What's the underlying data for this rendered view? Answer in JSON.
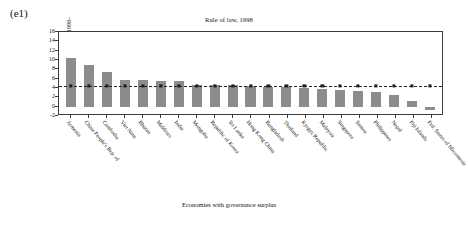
{
  "panel": {
    "label": "(e1)"
  },
  "chart_data": {
    "type": "bar",
    "title": "Rule of law, 1998",
    "xlabel": "Economies with governance surplus",
    "ylabel": "GDP per capita growth rate (%), 1998–2008",
    "ylim": [
      -2,
      16
    ],
    "yticks": [
      16,
      14,
      12,
      10,
      8,
      6,
      4,
      2,
      0,
      -2
    ],
    "grid": false,
    "legend": null,
    "reference_line": {
      "value": 4.5,
      "style": "dashed",
      "marker": "square"
    },
    "categories": [
      "Armenia",
      "China People's Rep. of",
      "Cambodia",
      "Viet Nam",
      "Bhutan",
      "Maldives",
      "India",
      "Mongolia",
      "Republic of Korea",
      "Sri Lanka",
      "Hong Kong China",
      "Bangladesh",
      "Thailand",
      "Kyrgyz Republic",
      "Malaysia",
      "Singapore",
      "Samoa",
      "Philippines",
      "Nepal",
      "Fiji Islands",
      "Fed. States of Micronesia"
    ],
    "values": [
      10.4,
      9.0,
      7.4,
      5.8,
      5.8,
      5.5,
      5.4,
      4.7,
      4.6,
      4.6,
      4.5,
      4.3,
      4.2,
      4.0,
      3.8,
      3.6,
      3.4,
      3.2,
      2.4,
      1.2,
      -0.7
    ],
    "series_color": "#8c8c8c"
  }
}
